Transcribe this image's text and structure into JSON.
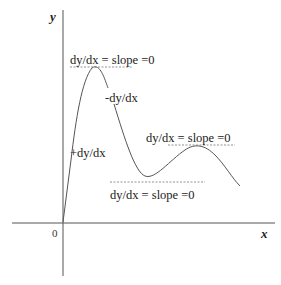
{
  "diagram": {
    "axes": {
      "x_label": "x",
      "y_label": "y",
      "origin_label": "0"
    },
    "annotations": {
      "max1": "dy/dx = slope =0",
      "decreasing": "-dy/dx",
      "increasing": "+dy/dx",
      "max2": "dy/dx = slope =0",
      "min": "dy/dx = slope =0"
    },
    "colors": {
      "line": "#555555",
      "text": "#222222"
    }
  }
}
